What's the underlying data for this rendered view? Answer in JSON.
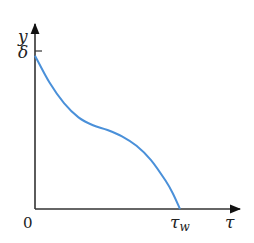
{
  "chart_data": {
    "type": "line",
    "title": "",
    "xlabel": "τ",
    "ylabel": "y",
    "origin_label": "0",
    "x_tick_labels": [
      {
        "value": 1.0,
        "label": "τ",
        "subscript": "w"
      }
    ],
    "y_tick_labels": [
      {
        "value": 1.0,
        "label": "δ"
      }
    ],
    "xlim": [
      0,
      1.4
    ],
    "ylim": [
      0,
      1.2
    ],
    "grid": false,
    "legend": "none",
    "series": [
      {
        "name": "y(τ)",
        "color": "#4a90d9",
        "x": [
          0.0,
          0.1,
          0.2,
          0.3,
          0.4,
          0.5,
          0.6,
          0.7,
          0.8,
          0.9,
          0.95,
          1.0
        ],
        "y": [
          0.97,
          0.8,
          0.67,
          0.58,
          0.53,
          0.5,
          0.46,
          0.4,
          0.31,
          0.18,
          0.1,
          0.0
        ]
      }
    ]
  }
}
